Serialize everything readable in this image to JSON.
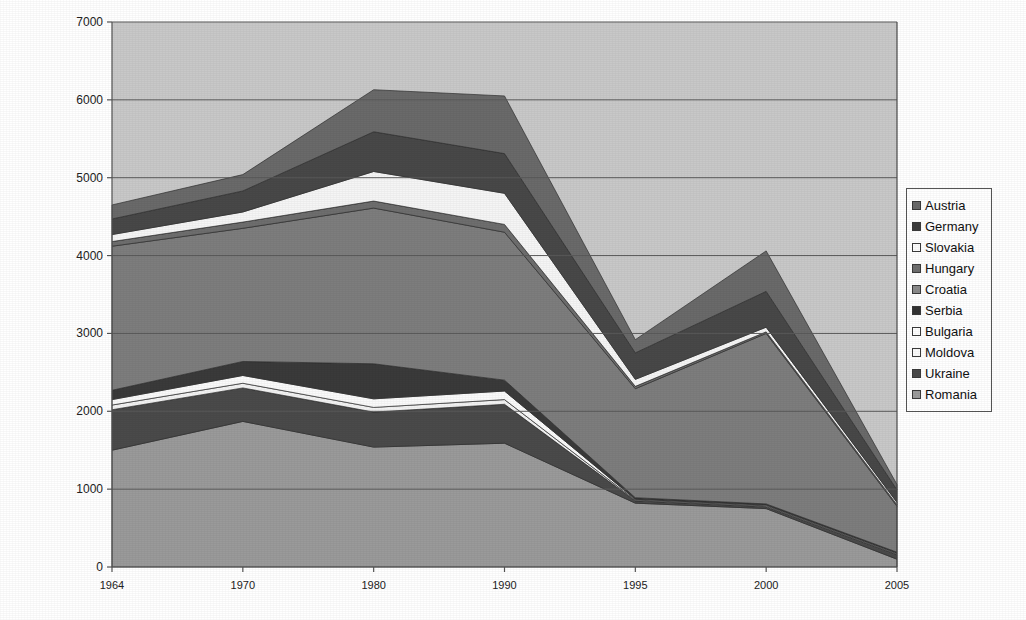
{
  "chart_data": {
    "type": "area",
    "stacked": true,
    "title": "",
    "subtitle": "",
    "xlabel": "",
    "ylabel": "",
    "categories": [
      "1964",
      "1970",
      "1980",
      "1990",
      "1995",
      "2000",
      "2005"
    ],
    "x_tick_labels": [
      "1964",
      "1970",
      "1980",
      "1990",
      "1995",
      "2000",
      "2005"
    ],
    "y_tick_labels": [
      "0",
      "1000",
      "2000",
      "3000",
      "4000",
      "5000",
      "6000",
      "7000"
    ],
    "ylim": [
      0,
      7000
    ],
    "y_tick_step": 1000,
    "grid": "horizontal",
    "legend_position": "right",
    "stack_order_bottom_to_top": [
      "Romania",
      "Ukraine",
      "Moldova",
      "Bulgaria",
      "Serbia",
      "Croatia",
      "Hungary",
      "Slovakia",
      "Germany",
      "Austria"
    ],
    "series": [
      {
        "name": "Romania",
        "color": "#9a9a9a",
        "values": [
          1500,
          1870,
          1540,
          1590,
          820,
          750,
          100
        ]
      },
      {
        "name": "Ukraine",
        "color": "#4a4a4a",
        "values": [
          520,
          430,
          450,
          500,
          30,
          25,
          60
        ]
      },
      {
        "name": "Moldova",
        "color": "#f2f2f2",
        "values": [
          60,
          60,
          60,
          60,
          10,
          10,
          10
        ]
      },
      {
        "name": "Bulgaria",
        "color": "#fafafa",
        "values": [
          70,
          100,
          110,
          110,
          10,
          10,
          10
        ]
      },
      {
        "name": "Serbia",
        "color": "#3a3a3a",
        "values": [
          120,
          180,
          450,
          140,
          20,
          15,
          10
        ]
      },
      {
        "name": "Croatia",
        "color": "#7d7d7d",
        "values": [
          1850,
          1710,
          2000,
          1900,
          1400,
          2190,
          590
        ]
      },
      {
        "name": "Hungary",
        "color": "#6e6e6e",
        "values": [
          60,
          80,
          90,
          100,
          30,
          20,
          20
        ]
      },
      {
        "name": "Slovakia",
        "color": "#f5f5f5",
        "values": [
          90,
          130,
          380,
          400,
          90,
          60,
          30
        ]
      },
      {
        "name": "Germany",
        "color": "#484848",
        "values": [
          200,
          270,
          510,
          510,
          340,
          460,
          160
        ]
      },
      {
        "name": "Austria",
        "color": "#6a6a6a",
        "values": [
          180,
          210,
          540,
          740,
          170,
          520,
          70
        ]
      }
    ],
    "stacked_totals": [
      4650,
      5040,
      6130,
      6050,
      2920,
      4060,
      1060
    ]
  },
  "legend": {
    "items": [
      {
        "label": "Austria",
        "color": "#6a6a6a"
      },
      {
        "label": "Germany",
        "color": "#3d3d3d"
      },
      {
        "label": "Slovakia",
        "color": "#fbfbfb"
      },
      {
        "label": "Hungary",
        "color": "#6e6e6e"
      },
      {
        "label": "Croatia",
        "color": "#8a8a8a"
      },
      {
        "label": "Serbia",
        "color": "#333333"
      },
      {
        "label": "Bulgaria",
        "color": "#fdfdfd"
      },
      {
        "label": "Moldova",
        "color": "#fafafa"
      },
      {
        "label": "Ukraine",
        "color": "#4a4a4a"
      },
      {
        "label": "Romania",
        "color": "#9c9c9c"
      }
    ]
  },
  "plot": {
    "background_color": "#c8c8c8",
    "axis_color": "#555555",
    "gridline_color": "#5a5a5a"
  }
}
